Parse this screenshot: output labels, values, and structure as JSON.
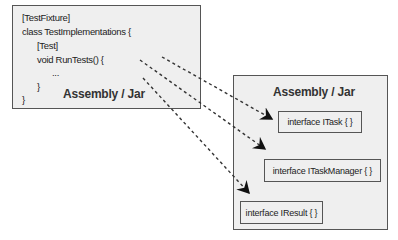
{
  "left_assembly": {
    "code_lines": [
      "[TestFixture]",
      "class TestImplementations {",
      "[Test]",
      "void RunTests() {",
      "...",
      "}",
      "}"
    ],
    "label": "Assembly / Jar"
  },
  "right_assembly": {
    "label": "Assembly / Jar",
    "interfaces": [
      "interface ITask { }",
      "interface ITaskManager { }",
      "interface IResult { }"
    ]
  },
  "arrows": [
    {
      "from": "left_assembly",
      "to": "interface ITask { }",
      "style": "dashed"
    },
    {
      "from": "left_assembly",
      "to": "interface ITaskManager { }",
      "style": "dashed"
    },
    {
      "from": "left_assembly",
      "to": "interface IResult { }",
      "style": "dashed"
    }
  ]
}
